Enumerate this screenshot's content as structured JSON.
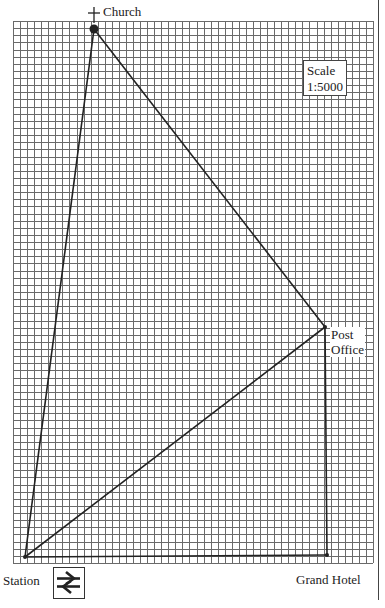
{
  "map": {
    "grid": {
      "left": 13,
      "top": 21,
      "right": 373,
      "bottom": 563,
      "cell": 7.1,
      "line_color": "#6a6a6a"
    },
    "route_color": "#222222",
    "locations": [
      {
        "name": "Church",
        "x": 94,
        "y": 29,
        "marker": "dot"
      },
      {
        "name": "Post Office",
        "x": 325,
        "y": 327,
        "marker": "point"
      },
      {
        "name": "Grand Hotel",
        "x": 327,
        "y": 555,
        "marker": "point"
      },
      {
        "name": "Station",
        "x": 25,
        "y": 557,
        "marker": "point"
      }
    ],
    "routes": [
      [
        "Station",
        "Church"
      ],
      [
        "Church",
        "Post Office"
      ],
      [
        "Station",
        "Post Office"
      ],
      [
        "Post Office",
        "Grand Hotel"
      ],
      [
        "Station",
        "Grand Hotel"
      ]
    ]
  },
  "labels": {
    "church": "Church",
    "church_symbol": "+",
    "post_office_line1": "Post",
    "post_office_line2": "Office",
    "station": "Station",
    "grand_hotel": "Grand Hotel",
    "scale_title": "Scale",
    "scale_value": "1:5000"
  },
  "icons": {
    "station_symbol": "rail-symbol"
  }
}
